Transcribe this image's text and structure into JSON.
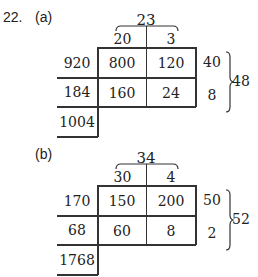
{
  "problem_number": "22.",
  "parts": [
    {
      "label": "(a)",
      "total": "23",
      "top_headers": [
        "20",
        "3"
      ],
      "left_values": [
        "920",
        "184"
      ],
      "cells": [
        [
          "800",
          "120"
        ],
        [
          "160",
          "24"
        ]
      ],
      "right_values": [
        "40",
        "8"
      ],
      "right_total": "48",
      "sum": "1004"
    },
    {
      "label": "(b)",
      "total": "34",
      "top_headers": [
        "30",
        "4"
      ],
      "left_values": [
        "170",
        "68"
      ],
      "cells": [
        [
          "150",
          "200"
        ],
        [
          "60",
          "8"
        ]
      ],
      "right_values": [
        "50",
        "2"
      ],
      "right_total": "52",
      "sum": "1768"
    }
  ]
}
